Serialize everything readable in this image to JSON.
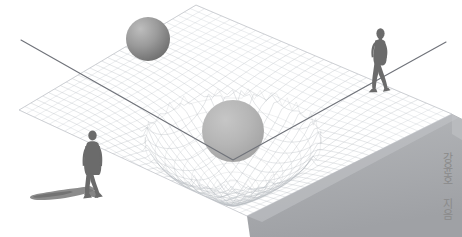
{
  "cover": {
    "width": 462,
    "height": 237,
    "background_color": "#ffffff",
    "subject": "spacetime-curvature-illustration"
  },
  "author_credit": {
    "text": "강윤호 지음",
    "name": "강윤호",
    "suffix": "지음",
    "color": "#8a8a8a",
    "orientation": "vertical"
  },
  "palette": {
    "background": "#ffffff",
    "grid_line": "#c9ccd1",
    "grid_line_dense": "#b5b9bf",
    "plane_edge": "#b8bbc0",
    "wedge_side": "#a8aaad",
    "wedge_shadow": "#9a9da1",
    "sphere_large": "#b4b4b4",
    "sphere_small_light": "#b9b9b9",
    "sphere_small_dark": "#7d7d7d",
    "figure": "#6e6e6e",
    "figure_shadow": "#8c8c8c",
    "light_ray": "#6f7277"
  },
  "elements": {
    "plane": {
      "name": "spacetime-grid-plane",
      "top_apex": [
        196,
        5
      ],
      "left_corner": [
        19,
        110
      ],
      "right_corner": [
        452,
        114
      ],
      "bottom_apex": [
        247,
        216
      ],
      "grid_divisions": 30
    },
    "well": {
      "name": "gravity-well",
      "center": [
        233,
        134
      ],
      "radius_x": 88,
      "radius_y": 46,
      "depth": 62
    },
    "sphere_large": {
      "name": "massive-body-sphere",
      "center": [
        233,
        131
      ],
      "radius": 31,
      "color": "#b4b4b4"
    },
    "sphere_small": {
      "name": "secondary-sphere",
      "center": [
        148,
        39
      ],
      "radius": 22,
      "color": "#8f8f8f"
    },
    "light_ray": {
      "name": "bending-light-ray",
      "start": [
        21,
        40
      ],
      "vertex": [
        233,
        160
      ],
      "end": [
        446,
        42
      ],
      "color": "#6f7277",
      "width": 1.2
    },
    "figure_right": {
      "name": "walking-figure-right",
      "position": [
        378,
        62
      ],
      "height": 68,
      "pose": "walking-side-view"
    },
    "figure_left": {
      "name": "walking-figure-left",
      "position": [
        92,
        165
      ],
      "height": 62,
      "pose": "walking-away-back-view"
    },
    "figure_left_shadow": {
      "name": "figure-shadow",
      "position": [
        55,
        193
      ],
      "length": 62
    },
    "wedge": {
      "name": "plane-thickness-wedge",
      "color": "#a8aaad"
    }
  }
}
